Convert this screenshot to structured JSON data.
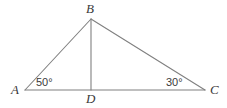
{
  "figure": {
    "type": "geometry-diagram",
    "shape": "triangle-with-cevian",
    "background_color": "#ffffff",
    "line_color": "#808080",
    "text_color": "#3a3a3a",
    "width": 227,
    "height": 108
  },
  "vertices": {
    "A": {
      "label": "A",
      "x": 25,
      "y": 90
    },
    "B": {
      "label": "B",
      "x": 91,
      "y": 19
    },
    "C": {
      "label": "C",
      "x": 205,
      "y": 90
    },
    "D": {
      "label": "D",
      "x": 91,
      "y": 90
    }
  },
  "segments": [
    {
      "name": "AB",
      "from": "A",
      "to": "B"
    },
    {
      "name": "BC",
      "from": "B",
      "to": "C"
    },
    {
      "name": "AC",
      "from": "A",
      "to": "C"
    },
    {
      "name": "BD",
      "from": "B",
      "to": "D"
    }
  ],
  "angles": {
    "at_A": {
      "value": 50,
      "label": "50°",
      "vertex": "A"
    },
    "at_C": {
      "value": 30,
      "label": "30°",
      "vertex": "C"
    }
  }
}
